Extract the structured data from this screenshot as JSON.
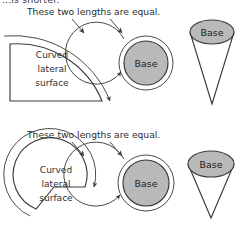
{
  "figure": {
    "title_partial_cut_off": "...is shorter.",
    "background_color": "#ffffff",
    "ink_color": "#3a3a3a",
    "base_fill_color": "#b9b9b9",
    "width": 242,
    "height": 231
  },
  "panels": [
    {
      "id": "top",
      "caption": "These two lengths are equal.",
      "arrow_count": 2,
      "sector": {
        "label_lines": [
          "Curved",
          "lateral",
          "surface"
        ],
        "description": "quarter-circle-sector-net",
        "arc_arrow": true
      },
      "circle": {
        "label": "Base",
        "arc_arrow": true
      },
      "cone": {
        "label": "Base",
        "description": "narrow-tall-cone"
      }
    },
    {
      "id": "bottom",
      "caption": "These two lengths are equal.",
      "arrow_count": 2,
      "sector": {
        "label_lines": [
          "Curved",
          "lateral",
          "surface"
        ],
        "description": "large-angle-sector-net",
        "arc_arrow": true
      },
      "circle": {
        "label": "Base",
        "arc_arrow": true
      },
      "cone": {
        "label": "Base",
        "description": "wide-short-cone"
      }
    }
  ]
}
